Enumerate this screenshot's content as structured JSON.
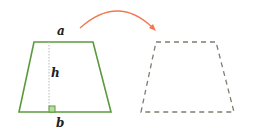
{
  "diagram": {
    "labels": {
      "top_base": "a",
      "height": "h",
      "bottom_base": "b"
    },
    "colors": {
      "trapezoid": "#5b9a3c",
      "right_angle_fill": "#b9dca0",
      "arrow": "#f07a4e",
      "dashed": "#7a7f70",
      "height_line": "#b8b8b8",
      "text": "#222222"
    }
  }
}
